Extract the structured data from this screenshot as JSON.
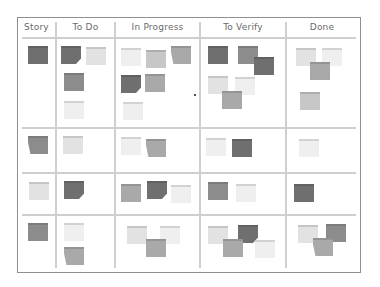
{
  "board": {
    "columns": [
      {
        "key": "story",
        "label": "Story"
      },
      {
        "key": "todo",
        "label": "To Do"
      },
      {
        "key": "inprogress",
        "label": "In Progress"
      },
      {
        "key": "toverify",
        "label": "To Verify"
      },
      {
        "key": "done",
        "label": "Done"
      }
    ],
    "rows": [
      {
        "story": [
          {
            "shade": "dark"
          }
        ],
        "todo": [
          {
            "shade": "dark"
          },
          {
            "shade": "light"
          },
          {
            "shade": "medium"
          },
          {
            "shade": "very-light"
          }
        ],
        "inprogress": [
          {
            "shade": "very-light"
          },
          {
            "shade": "light"
          },
          {
            "shade": "medium"
          },
          {
            "shade": "dark"
          },
          {
            "shade": "medium"
          },
          {
            "shade": "very-light"
          }
        ],
        "toverify": [
          {
            "shade": "dark"
          },
          {
            "shade": "medium"
          },
          {
            "shade": "dark"
          },
          {
            "shade": "light"
          },
          {
            "shade": "very-light"
          },
          {
            "shade": "medium"
          }
        ],
        "done": [
          {
            "shade": "light"
          },
          {
            "shade": "very-light"
          },
          {
            "shade": "medium"
          },
          {
            "shade": "light"
          }
        ]
      },
      {
        "story": [
          {
            "shade": "medium"
          }
        ],
        "todo": [
          {
            "shade": "light"
          }
        ],
        "inprogress": [
          {
            "shade": "very-light"
          },
          {
            "shade": "medium"
          }
        ],
        "toverify": [
          {
            "shade": "very-light"
          },
          {
            "shade": "dark"
          }
        ],
        "done": [
          {
            "shade": "very-light"
          }
        ]
      },
      {
        "story": [
          {
            "shade": "light"
          }
        ],
        "todo": [
          {
            "shade": "dark"
          }
        ],
        "inprogress": [
          {
            "shade": "medium"
          },
          {
            "shade": "dark"
          },
          {
            "shade": "very-light"
          }
        ],
        "toverify": [
          {
            "shade": "medium"
          },
          {
            "shade": "very-light"
          }
        ],
        "done": [
          {
            "shade": "dark"
          }
        ]
      },
      {
        "story": [
          {
            "shade": "medium"
          }
        ],
        "todo": [
          {
            "shade": "very-light"
          },
          {
            "shade": "medium"
          }
        ],
        "inprogress": [
          {
            "shade": "light"
          },
          {
            "shade": "very-light"
          },
          {
            "shade": "medium"
          }
        ],
        "toverify": [
          {
            "shade": "light"
          },
          {
            "shade": "dark"
          },
          {
            "shade": "medium"
          },
          {
            "shade": "very-light"
          }
        ],
        "done": [
          {
            "shade": "light"
          },
          {
            "shade": "medium"
          },
          {
            "shade": "medium"
          }
        ]
      }
    ]
  },
  "colors": {
    "dark": "#6f6f6f",
    "medium": "#999999",
    "light": "#cfcfcf",
    "very-light": "#ececec",
    "grid": "#cfcfcf",
    "border": "#8f8f8f",
    "header_text": "#6a6a6a"
  }
}
